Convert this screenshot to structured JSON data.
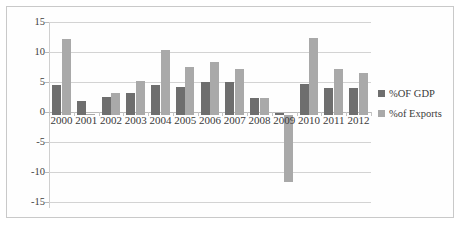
{
  "chart_data": {
    "type": "bar",
    "title": "",
    "subtitle": "",
    "xlabel": "",
    "ylabel": "",
    "ylim": [
      -15,
      15
    ],
    "yticks": [
      15,
      10,
      5,
      0,
      -5,
      -10,
      -15
    ],
    "grid": true,
    "legend_position": "right",
    "categories": [
      "2000",
      "2001",
      "2002",
      "2003",
      "2004",
      "2005",
      "2006",
      "2007",
      "2008",
      "2009",
      "2010",
      "2011",
      "2012"
    ],
    "series": [
      {
        "name": "%OF GDP",
        "color": "#6e6e6e",
        "values": [
          4.8,
          2.3,
          2.9,
          3.6,
          4.9,
          4.5,
          5.3,
          5.3,
          2.8,
          0.4,
          5.0,
          4.4,
          4.4
        ]
      },
      {
        "name": "%of Exports",
        "color": "#a9a9a9",
        "values": [
          12.3,
          0.1,
          3.6,
          5.5,
          10.5,
          7.7,
          8.6,
          7.4,
          2.7,
          -10.8,
          12.4,
          7.4,
          6.8
        ]
      }
    ]
  },
  "legend": {
    "items": [
      {
        "label": "%OF GDP",
        "swatch": "gdp"
      },
      {
        "label": "%of Exports",
        "swatch": "exp"
      }
    ]
  }
}
